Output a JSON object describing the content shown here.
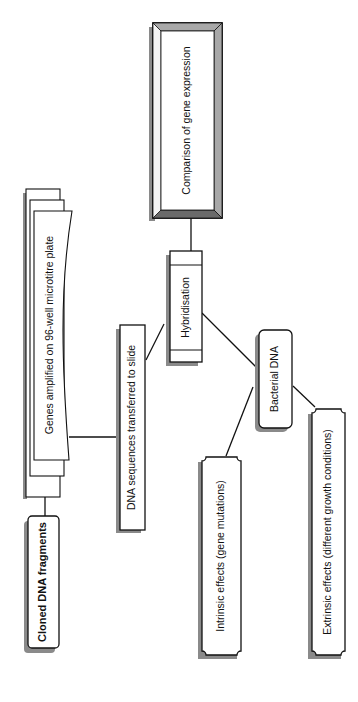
{
  "diagram": {
    "orientation": "rotated-90-ccw",
    "nodes": {
      "comparison": {
        "label": "Comparison of gene expression",
        "style": "beveled-frame"
      },
      "hybridisation": {
        "label": "Hybridisation",
        "style": "banded-rectangle"
      },
      "dna_sequences": {
        "label": "DNA sequences transferred to slide",
        "style": "rectangle-shadow"
      },
      "genes_amplified": {
        "label": "Genes amplified on 96-well microtitre plate",
        "style": "stacked-documents"
      },
      "cloned_dna": {
        "label": "Cloned DNA fragments",
        "style": "rounded-bold"
      },
      "bacterial_dna": {
        "label": "Bacterial DNA",
        "style": "rounded-shadow"
      },
      "intrinsic": {
        "label": "Intrinsic effects (gene mutations)",
        "style": "notched-corners"
      },
      "extrinsic": {
        "label": "Extrinsic effects (different growth conditions)",
        "style": "notched-corners"
      }
    },
    "edges": [
      {
        "from": "cloned_dna",
        "to": "genes_amplified"
      },
      {
        "from": "genes_amplified",
        "to": "dna_sequences"
      },
      {
        "from": "dna_sequences",
        "to": "hybridisation"
      },
      {
        "from": "hybridisation",
        "to": "comparison"
      },
      {
        "from": "bacterial_dna",
        "to": "hybridisation"
      },
      {
        "from": "intrinsic",
        "to": "bacterial_dna"
      },
      {
        "from": "extrinsic",
        "to": "bacterial_dna"
      }
    ],
    "colors": {
      "stroke": "#111111",
      "shadow": "#8a8a8a",
      "bevel_dark": "#555555",
      "bevel_light": "#bdbdbd",
      "fill": "#ffffff"
    }
  }
}
